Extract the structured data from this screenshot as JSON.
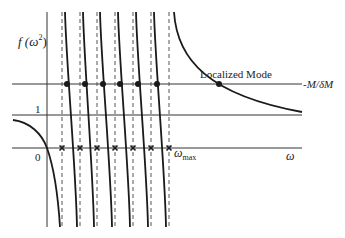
{
  "figure": {
    "ylabel": "f(ω²)",
    "ylabel_base": "f (ω",
    "ylabel_sup": "2",
    "ylabel_close": ")",
    "xlabel": "ω",
    "tick_one": "1",
    "tick_zero": "0",
    "wmax_label": "ω",
    "wmax_sub": "max",
    "hline_label": "-M/δM",
    "annotation": "Localized Mode"
  },
  "geometry": {
    "y_axis_x": 47,
    "y_top": 12,
    "y_bottom": 227,
    "x_axis_y": 148,
    "line_one_y": 115,
    "hline_y": 84,
    "x_left": 12,
    "x_right": 302,
    "poles_x": [
      62,
      80,
      97,
      115,
      133,
      151,
      169
    ],
    "crossings_x": [
      67,
      85,
      103,
      120,
      138,
      157
    ],
    "localized_mode": {
      "x": 219,
      "y": 84
    }
  },
  "colors": {
    "curve": "#1a1a1a",
    "axis": "#333333",
    "dash": "#555555"
  },
  "chart_data": {
    "type": "line",
    "title": "",
    "xlabel": "ω",
    "ylabel": "f(ω²)",
    "y_ticks": [
      "0",
      "1"
    ],
    "x_ticks": [
      "0",
      "ω_max"
    ],
    "horizontal_reference": "-M/δM",
    "poles_count": 7,
    "intersections_count": 6,
    "annotation": "Localized Mode"
  }
}
